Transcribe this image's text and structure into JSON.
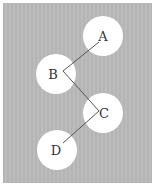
{
  "diagram": {
    "type": "tree",
    "background_color": "#b8b8b8",
    "node_color": "#ffffff",
    "edge_color": "#555555",
    "nodes": [
      {
        "id": "A",
        "label": "A",
        "cx": 103,
        "cy": 36,
        "r": 20,
        "lx": 103,
        "ly": 41
      },
      {
        "id": "B",
        "label": "B",
        "cx": 56,
        "cy": 74,
        "r": 20,
        "lx": 53,
        "ly": 79
      },
      {
        "id": "C",
        "label": "C",
        "cx": 103,
        "cy": 113,
        "r": 20,
        "lx": 104,
        "ly": 118
      },
      {
        "id": "D",
        "label": "D",
        "cx": 57,
        "cy": 150,
        "r": 20,
        "lx": 56,
        "ly": 155
      }
    ],
    "edges": [
      {
        "from": "A",
        "to": "B",
        "x1": 99,
        "y1": 42,
        "x2": 63,
        "y2": 71
      },
      {
        "from": "B",
        "to": "C",
        "x1": 63,
        "y1": 71,
        "x2": 99,
        "y2": 111
      },
      {
        "from": "C",
        "to": "D",
        "x1": 99,
        "y1": 111,
        "x2": 63,
        "y2": 143
      }
    ]
  }
}
